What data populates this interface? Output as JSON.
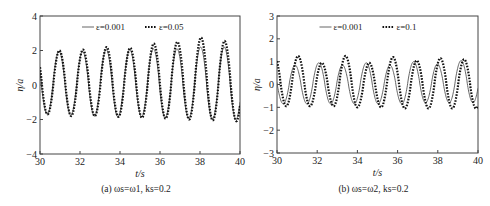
{
  "chart_data": [
    {
      "id": "a",
      "type": "line",
      "caption": "(a) ωs=ω1,  ks=0.2",
      "xlabel": "t/s",
      "ylabel": "η/a",
      "xlim": [
        30,
        40
      ],
      "ylim": [
        -4,
        4
      ],
      "xticks": [
        30,
        32,
        34,
        36,
        38,
        40
      ],
      "yticks": [
        -4,
        -2,
        0,
        2,
        4
      ],
      "grid": false,
      "legend_position": "top-center",
      "frame_px": {
        "left": 40,
        "top": 16,
        "right": 240,
        "bottom": 154
      },
      "series": [
        {
          "name": "ε=0.001",
          "style": "solid",
          "color": "#555555",
          "model": {
            "period": 1.18,
            "phase_t0": 30.95,
            "amp_pos": [
              1.95,
              1.95,
              2.05,
              2.05,
              2.1,
              2.1,
              2.2,
              2.2,
              2.2
            ],
            "amp_neg": [
              -1.7,
              -1.75,
              -1.8,
              -1.85,
              -1.85,
              -1.9,
              -1.95,
              -2.0,
              -2.0,
              -2.05
            ]
          }
        },
        {
          "name": "ε=0.05",
          "style": "dotted",
          "color": "#111111",
          "model": {
            "period": 1.18,
            "phase_t0": 30.97,
            "amp_pos": [
              2.0,
              2.05,
              2.2,
              2.15,
              2.4,
              2.5,
              2.75,
              2.55,
              2.6
            ],
            "amp_neg": [
              -1.7,
              -1.8,
              -1.8,
              -1.85,
              -1.9,
              -1.95,
              -2.0,
              -2.05,
              -2.1,
              -2.1
            ]
          }
        }
      ]
    },
    {
      "id": "b",
      "type": "line",
      "caption": "(b) ωs=ω2,  ks=0.2",
      "xlabel": "t/s",
      "ylabel": "η/a",
      "xlim": [
        30,
        40
      ],
      "ylim": [
        -3,
        3
      ],
      "xticks": [
        30,
        32,
        34,
        36,
        38,
        40
      ],
      "yticks": [
        -3,
        -2,
        -1,
        0,
        1,
        2,
        3
      ],
      "grid": false,
      "legend_position": "top-center",
      "frame_px": {
        "left": 277,
        "top": 16,
        "right": 478,
        "bottom": 153
      },
      "series": [
        {
          "name": "ε=0.001",
          "style": "solid",
          "color": "#555555",
          "model": {
            "period": 1.18,
            "phase_t0": 30.9,
            "amp_pos": [
              0.85,
              0.95,
              0.85,
              0.95,
              0.85,
              1.0,
              0.9,
              1.05,
              0.95
            ],
            "amp_neg": [
              -0.85,
              -0.85,
              -0.85,
              -0.85,
              -0.85,
              -0.85,
              -0.8,
              -0.8,
              -0.8,
              -0.8
            ]
          }
        },
        {
          "name": "ε=0.1",
          "style": "dotted",
          "color": "#111111",
          "model": {
            "period": 1.18,
            "phase_t0": 31.05,
            "amp_pos": [
              1.25,
              0.95,
              1.25,
              0.95,
              1.2,
              1.05,
              1.15,
              1.1,
              1.1
            ],
            "amp_neg": [
              -0.95,
              -0.95,
              -0.95,
              -1.0,
              -1.0,
              -1.05,
              -1.05,
              -1.05,
              -1.05,
              -1.0
            ]
          }
        }
      ]
    }
  ],
  "figure": {
    "captions": [
      "(a) ωs=ω1,  ks=0.2",
      "(b) ωs=ω2,  ks=0.2"
    ]
  }
}
